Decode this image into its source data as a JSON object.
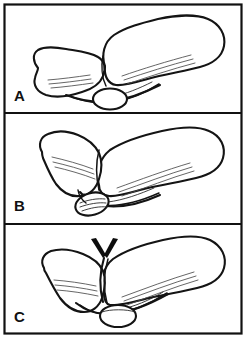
{
  "figure": {
    "style": "black-ink line art on white background",
    "width": 246,
    "height": 338,
    "frame_color": "#111111",
    "ink_color": "#141414",
    "background_color": "#ffffff"
  },
  "panels": [
    {
      "id": "panel-a",
      "label": "A",
      "label_x": 14,
      "label_y": 101,
      "caption": "",
      "arrow_present": false,
      "description": "Proximal bone angled upward to the right with a rounded joint head; smaller bone to the left; small oval sesamoid sits below the joint"
    },
    {
      "id": "panel-b",
      "label": "B",
      "label_x": 14,
      "label_y": 211,
      "caption": "",
      "arrow_present": false,
      "description": "Joint with the oval sesamoid displaced downward and tilted, shown with internal striations"
    },
    {
      "id": "panel-c",
      "label": "C",
      "label_x": 14,
      "label_y": 322,
      "caption": "",
      "arrow_present": true,
      "arrow_type": "v-chevron",
      "arrow_x": 104,
      "arrow_y": 246,
      "description": "Joint with a V-shaped chevron arrow marker pointing down at the joint line; oval sesamoid seated below"
    }
  ],
  "dividers": [
    {
      "y": 113
    },
    {
      "y": 224
    }
  ],
  "frame": {
    "x": 4,
    "y": 4,
    "width": 238,
    "height": 330
  },
  "colors": {
    "ink": "#141414",
    "hatch": "#4a4a4a",
    "frame": "#111111",
    "paper": "#ffffff",
    "arrow": "#0d0d0d"
  }
}
